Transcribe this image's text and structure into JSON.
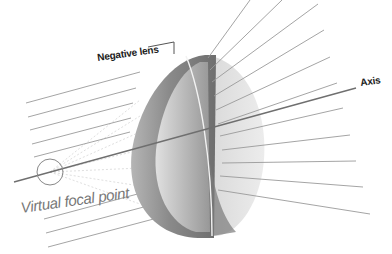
{
  "diagram": {
    "labels": {
      "lens": "Negative lens",
      "axis": "Axis",
      "focal_point": "Virtual focal point"
    },
    "colors": {
      "background": "#ffffff",
      "ray": "#9a9a9a",
      "ray_dark": "#6f6f6f",
      "lens_front": "#8e8e8e",
      "lens_rim": "#c8c8c8",
      "lens_back": "#dcdcdc",
      "focal_circle": "#888888",
      "focal_label": "#777777",
      "text": "#222222"
    },
    "focal_point": {
      "cx": 50,
      "cy": 172,
      "r": 13
    },
    "axis_line": {
      "x1": 14,
      "y1": 182,
      "x2": 356,
      "y2": 88
    },
    "lens_leader": {
      "points": "148,47 174,42 174,54"
    },
    "incoming_rays": [
      {
        "x1": 26,
        "y1": 103,
        "x2": 140,
        "y2": 72
      },
      {
        "x1": 28,
        "y1": 117,
        "x2": 136,
        "y2": 88
      },
      {
        "x1": 30,
        "y1": 130,
        "x2": 133,
        "y2": 103
      },
      {
        "x1": 32,
        "y1": 144,
        "x2": 131,
        "y2": 118
      },
      {
        "x1": 34,
        "y1": 157,
        "x2": 130,
        "y2": 132
      },
      {
        "x1": 44,
        "y1": 219,
        "x2": 160,
        "y2": 188
      },
      {
        "x1": 46,
        "y1": 233,
        "x2": 170,
        "y2": 200
      },
      {
        "x1": 48,
        "y1": 247,
        "x2": 180,
        "y2": 212
      }
    ],
    "outgoing_rays": [
      {
        "x1": 208,
        "y1": 58,
        "x2": 250,
        "y2": 0
      },
      {
        "x1": 210,
        "y1": 70,
        "x2": 282,
        "y2": 0
      },
      {
        "x1": 212,
        "y1": 82,
        "x2": 318,
        "y2": 4
      },
      {
        "x1": 214,
        "y1": 96,
        "x2": 324,
        "y2": 30
      },
      {
        "x1": 216,
        "y1": 110,
        "x2": 330,
        "y2": 57
      },
      {
        "x1": 218,
        "y1": 124,
        "x2": 337,
        "y2": 83
      },
      {
        "x1": 220,
        "y1": 136,
        "x2": 343,
        "y2": 108
      },
      {
        "x1": 222,
        "y1": 150,
        "x2": 350,
        "y2": 135
      },
      {
        "x1": 222,
        "y1": 163,
        "x2": 356,
        "y2": 161
      },
      {
        "x1": 220,
        "y1": 176,
        "x2": 363,
        "y2": 187
      },
      {
        "x1": 218,
        "y1": 190,
        "x2": 370,
        "y2": 214
      }
    ],
    "virtual_traces": [
      {
        "x1": 50,
        "y1": 172,
        "x2": 140,
        "y2": 100
      },
      {
        "x1": 50,
        "y1": 172,
        "x2": 140,
        "y2": 116
      },
      {
        "x1": 50,
        "y1": 172,
        "x2": 140,
        "y2": 132
      },
      {
        "x1": 50,
        "y1": 172,
        "x2": 140,
        "y2": 150
      },
      {
        "x1": 50,
        "y1": 172,
        "x2": 140,
        "y2": 168
      },
      {
        "x1": 50,
        "y1": 172,
        "x2": 140,
        "y2": 186
      },
      {
        "x1": 50,
        "y1": 172,
        "x2": 140,
        "y2": 204
      }
    ]
  }
}
